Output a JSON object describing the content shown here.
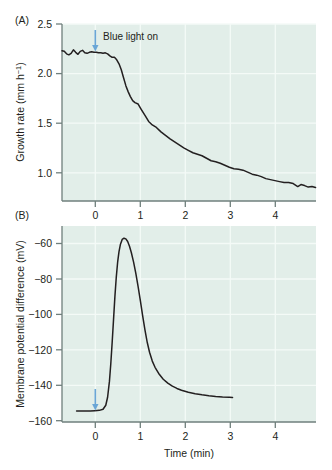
{
  "figure": {
    "background_color": "#ffffff",
    "plot_background_color": "#e2eee9",
    "gridline_color": "#f4faf7",
    "axis_color": "#6f7f7c",
    "trace_color": "#231f20",
    "arrow_color": "#6aa6d6"
  },
  "panelA": {
    "label": "(A)",
    "ylabel_main": "Growth rate (mm h",
    "ylabel_sup": "−1",
    "ylabel_close": ")",
    "ylabel_full": "Growth rate (mm h⁻¹)",
    "y_ticks": [
      "2.5",
      "2.0",
      "1.5",
      "1.0"
    ],
    "y_tick_values": [
      2.5,
      2.0,
      1.5,
      1.0
    ],
    "x_ticks": [
      "0",
      "1",
      "2",
      "3",
      "4"
    ],
    "x_tick_values": [
      0,
      1,
      2,
      3,
      4
    ],
    "annotation": {
      "text": "Blue light on",
      "arrow": "down-arrow",
      "x_value": 0
    }
  },
  "panelB": {
    "label": "(B)",
    "ylabel_full": "Membrane potential difference (mV)",
    "y_ticks": [
      "−60",
      "−80",
      "−100",
      "−120",
      "−140",
      "−160"
    ],
    "y_tick_values": [
      -60,
      -80,
      -100,
      -120,
      -140,
      -160
    ],
    "x_ticks": [
      "0",
      "1",
      "2",
      "3",
      "4"
    ],
    "x_tick_values": [
      0,
      1,
      2,
      3,
      4
    ],
    "xlabel": "Time (min)",
    "annotation": {
      "arrow": "down-arrow",
      "x_value": 0
    }
  },
  "chart_data": [
    {
      "type": "line",
      "id": "panel-A",
      "title": "(A)",
      "xlabel": "Time (min)",
      "ylabel": "Growth rate (mm h⁻¹)",
      "xlim": [
        -0.62,
        4.95
      ],
      "ylim": [
        0.78,
        2.56
      ],
      "grid": true,
      "legend": null,
      "annotations": [
        {
          "text": "Blue light on",
          "x": 0,
          "y": 2.45,
          "marker": "blue down arrow at x=0"
        }
      ],
      "series": [
        {
          "name": "Growth rate",
          "x": [
            -0.62,
            -0.57,
            -0.52,
            -0.47,
            -0.42,
            -0.37,
            -0.32,
            -0.27,
            -0.22,
            -0.17,
            -0.12,
            -0.07,
            -0.02,
            0.03,
            0.08,
            0.13,
            0.18,
            0.23,
            0.28,
            0.33,
            0.38,
            0.43,
            0.48,
            0.53,
            0.58,
            0.63,
            0.68,
            0.73,
            0.78,
            0.83,
            0.88,
            0.93,
            0.98,
            1.05,
            1.12,
            1.2,
            1.28,
            1.36,
            1.45,
            1.55,
            1.65,
            1.75,
            1.85,
            1.95,
            2.05,
            2.15,
            2.25,
            2.35,
            2.45,
            2.55,
            2.65,
            2.75,
            2.85,
            2.95,
            3.05,
            3.15,
            3.25,
            3.35,
            3.45,
            3.55,
            3.65,
            3.75,
            3.85,
            3.95,
            4.05,
            4.15,
            4.25,
            4.35,
            4.45,
            4.55,
            4.62,
            4.7,
            4.78,
            4.86,
            4.94
          ],
          "y": [
            2.29,
            2.285,
            2.26,
            2.25,
            2.265,
            2.3,
            2.275,
            2.255,
            2.285,
            2.295,
            2.27,
            2.265,
            2.275,
            2.28,
            2.275,
            2.275,
            2.27,
            2.27,
            2.265,
            2.27,
            2.26,
            2.24,
            2.225,
            2.225,
            2.2,
            2.16,
            2.1,
            2.02,
            1.94,
            1.88,
            1.83,
            1.79,
            1.77,
            1.755,
            1.7,
            1.64,
            1.58,
            1.545,
            1.52,
            1.475,
            1.44,
            1.405,
            1.375,
            1.345,
            1.315,
            1.29,
            1.265,
            1.25,
            1.235,
            1.21,
            1.185,
            1.175,
            1.16,
            1.14,
            1.12,
            1.105,
            1.1,
            1.09,
            1.07,
            1.05,
            1.04,
            1.025,
            1.005,
            0.995,
            0.985,
            0.975,
            0.965,
            0.965,
            0.955,
            0.925,
            0.945,
            0.935,
            0.92,
            0.925,
            0.915
          ]
        }
      ]
    },
    {
      "type": "line",
      "id": "panel-B",
      "title": "(B)",
      "xlabel": "Time (min)",
      "ylabel": "Membrane potential difference (mV)",
      "xlim": [
        -0.62,
        4.95
      ],
      "ylim": [
        -163,
        -52
      ],
      "grid": true,
      "legend": null,
      "annotations": [
        {
          "text": "",
          "x": 0,
          "y": -150,
          "marker": "blue down arrow at x=0"
        }
      ],
      "series": [
        {
          "name": "Membrane potential difference",
          "x": [
            -0.3,
            -0.2,
            -0.1,
            0.0,
            0.1,
            0.2,
            0.28,
            0.34,
            0.38,
            0.42,
            0.45,
            0.48,
            0.51,
            0.54,
            0.57,
            0.6,
            0.63,
            0.66,
            0.7,
            0.74,
            0.78,
            0.82,
            0.86,
            0.9,
            0.95,
            1.0,
            1.05,
            1.1,
            1.15,
            1.2,
            1.25,
            1.3,
            1.36,
            1.42,
            1.5,
            1.6,
            1.7,
            1.8,
            1.9,
            2.0,
            2.15,
            2.3,
            2.45,
            2.6,
            2.75,
            2.9,
            3.05,
            3.12
          ],
          "y": [
            -156.8,
            -156.8,
            -156.8,
            -156.8,
            -156.6,
            -156.4,
            -155.8,
            -153.5,
            -149.0,
            -140.0,
            -130.0,
            -118.0,
            -105.0,
            -92.0,
            -81.0,
            -72.5,
            -66.5,
            -62.5,
            -59.6,
            -58.9,
            -59.3,
            -60.8,
            -63.5,
            -67.0,
            -72.5,
            -79.0,
            -86.5,
            -94.5,
            -103.0,
            -111.0,
            -118.0,
            -123.5,
            -128.5,
            -132.0,
            -135.5,
            -138.8,
            -141.0,
            -142.7,
            -144.0,
            -145.0,
            -146.2,
            -147.0,
            -147.6,
            -148.1,
            -148.5,
            -148.8,
            -149.0,
            -149.1
          ]
        }
      ]
    }
  ]
}
